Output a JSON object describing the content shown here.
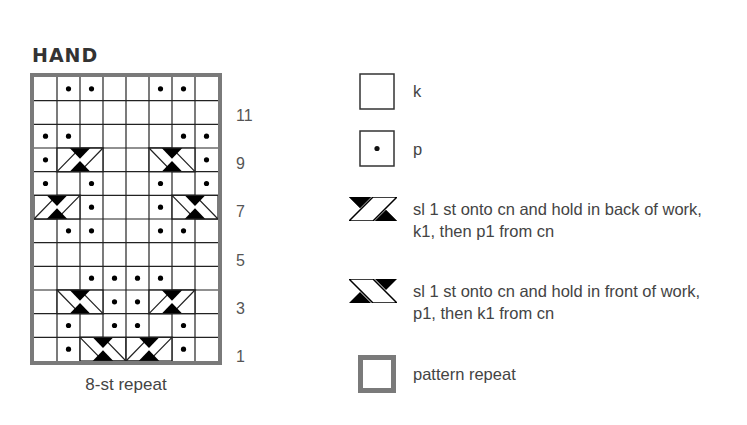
{
  "title": "HAND",
  "chart": {
    "columns": 8,
    "rows": 12,
    "row_numbers": [
      "11",
      "9",
      "7",
      "5",
      "3",
      "1"
    ],
    "repeat_label": "8-st repeat",
    "grid_top_to_bottom": [
      [
        "k",
        "p",
        "p",
        "k",
        "k",
        "p",
        "p",
        "k"
      ],
      [
        "k",
        "k",
        "k",
        "k",
        "k",
        "k",
        "k",
        "k"
      ],
      [
        "p",
        "p",
        "k",
        "k",
        "k",
        "k",
        "p",
        "p"
      ],
      [
        "p",
        "RB",
        "RB",
        "k",
        "k",
        "LF",
        "LF",
        "p"
      ],
      [
        "p",
        "k",
        "p",
        "k",
        "k",
        "p",
        "k",
        "p"
      ],
      [
        "RB",
        "RB",
        "p",
        "k",
        "k",
        "p",
        "LF",
        "LF"
      ],
      [
        "k",
        "p",
        "p",
        "k",
        "k",
        "p",
        "p",
        "k"
      ],
      [
        "k",
        "k",
        "k",
        "k",
        "k",
        "k",
        "k",
        "k"
      ],
      [
        "k",
        "k",
        "p",
        "p",
        "p",
        "p",
        "k",
        "k"
      ],
      [
        "k",
        "LF",
        "LF",
        "p",
        "p",
        "RB",
        "RB",
        "k"
      ],
      [
        "k",
        "p",
        "k",
        "p",
        "p",
        "k",
        "p",
        "k"
      ],
      [
        "k",
        "p",
        "LF",
        "LF",
        "RB",
        "RB",
        "p",
        "k"
      ]
    ],
    "colors": {
      "grid_line": "#222222",
      "repeat_border": "#7a7a7a",
      "fill": "#000000"
    }
  },
  "legend": {
    "k": {
      "symbol": "empty-square",
      "label": "k"
    },
    "p": {
      "symbol": "dot-square",
      "label": "p"
    },
    "back_cable": {
      "symbol": "RB",
      "line1": "sl 1 st onto cn and hold in back of work,",
      "line2": "k1, then p1 from cn"
    },
    "front_cable": {
      "symbol": "LF",
      "line1": "sl 1 st onto cn and hold in front of work,",
      "line2": "p1, then k1 from cn"
    },
    "repeat": {
      "symbol": "gray-square",
      "label": "pattern repeat"
    }
  }
}
